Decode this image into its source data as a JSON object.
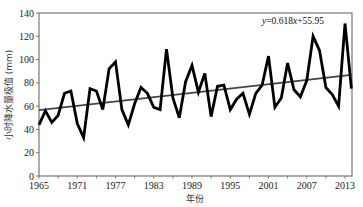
{
  "chart_data": {
    "type": "line",
    "title": "",
    "xlabel": "年份",
    "ylabel": "小时降水量极值 (mm)",
    "xlim": [
      1965,
      2015
    ],
    "ylim": [
      0,
      140
    ],
    "x_ticks": [
      1965,
      1971,
      1977,
      1983,
      1989,
      1995,
      2001,
      2007,
      2013
    ],
    "y_ticks": [
      0,
      20,
      40,
      60,
      80,
      100,
      120,
      140
    ],
    "grid": false,
    "x": [
      1965,
      1966,
      1967,
      1968,
      1969,
      1970,
      1971,
      1972,
      1973,
      1974,
      1975,
      1976,
      1977,
      1978,
      1979,
      1980,
      1981,
      1982,
      1983,
      1984,
      1985,
      1986,
      1987,
      1988,
      1989,
      1990,
      1991,
      1992,
      1993,
      1994,
      1995,
      1996,
      1997,
      1998,
      1999,
      2000,
      2001,
      2002,
      2003,
      2004,
      2005,
      2006,
      2007,
      2008,
      2009,
      2010,
      2011,
      2012,
      2013,
      2014
    ],
    "series": [
      {
        "name": "小时降水量极值",
        "values": [
          44,
          56,
          46,
          52,
          71,
          73,
          45,
          33,
          75,
          73,
          57,
          92,
          98,
          57,
          44,
          62,
          76,
          71,
          59,
          57,
          109,
          67,
          50,
          81,
          95,
          72,
          88,
          51,
          77,
          78,
          57,
          66,
          71,
          53,
          71,
          78,
          103,
          59,
          67,
          97,
          74,
          68,
          82,
          120,
          108,
          76,
          70,
          60,
          131,
          75
        ]
      }
    ],
    "trendline": {
      "equation": "y=0.618x+55.95",
      "slope": 0.618,
      "intercept": 55.95
    },
    "annotations": [
      "y=0.618x+55.95"
    ]
  }
}
